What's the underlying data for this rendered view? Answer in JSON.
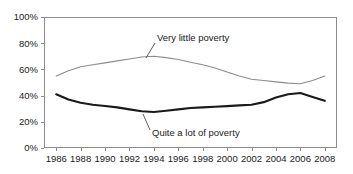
{
  "chart_data": {
    "type": "line",
    "title": "",
    "subtitle": "",
    "xlabel": "",
    "ylabel": "",
    "grid": false,
    "legend_position": "inline-annotations",
    "x": [
      1986,
      1987,
      1988,
      1989,
      1990,
      1991,
      1992,
      1993,
      1994,
      1995,
      1996,
      1997,
      1998,
      1999,
      2000,
      2001,
      2002,
      2003,
      2004,
      2005,
      2006,
      2007,
      2008
    ],
    "xlim": [
      1985,
      2009
    ],
    "ylim": [
      0,
      100
    ],
    "x_tick_labels": [
      "1986",
      "1988",
      "1990",
      "1992",
      "1994",
      "1996",
      "1998",
      "2000",
      "2002",
      "2004",
      "2006",
      "2008"
    ],
    "x_tick_values": [
      1986,
      1988,
      1990,
      1992,
      1994,
      1996,
      1998,
      2000,
      2002,
      2004,
      2006,
      2008
    ],
    "y_tick_labels": [
      "0%",
      "20%",
      "40%",
      "60%",
      "80%",
      "100%"
    ],
    "y_tick_values": [
      0,
      20,
      40,
      60,
      80,
      100
    ],
    "series": [
      {
        "name": "Very little poverty",
        "color": "#8c8c8c",
        "width": 1.1,
        "values": [
          55,
          59,
          62,
          63.5,
          65,
          66.5,
          68,
          69.5,
          70,
          69,
          67.5,
          65.5,
          63.5,
          61,
          58,
          55,
          52.5,
          51.5,
          50.5,
          49.5,
          49,
          51.5,
          55
        ]
      },
      {
        "name": "Quite a lot of poverty",
        "color": "#1a1a1a",
        "width": 2.1,
        "values": [
          41,
          37,
          34.5,
          33,
          32,
          31,
          29.5,
          28,
          27.5,
          28.5,
          29.5,
          30.5,
          31,
          31.5,
          32,
          32.5,
          33,
          35,
          38.5,
          41,
          42,
          39,
          36
        ]
      }
    ],
    "annotations": [
      {
        "name": "very-little-poverty",
        "text": "Very little poverty",
        "text_x": 157,
        "text_y": 41,
        "leader_from_x": 155,
        "leader_from_y": 43,
        "leader_to_x": 146,
        "leader_to_y": 58
      },
      {
        "name": "quite-a-lot-of-poverty",
        "text": "Quite a lot of poverty",
        "text_x": 152,
        "text_y": 136,
        "leader_from_x": 150,
        "leader_from_y": 130,
        "leader_to_x": 143,
        "leader_to_y": 114
      }
    ],
    "plot_box": {
      "left": 44,
      "top": 17,
      "right": 337,
      "bottom": 148
    },
    "axis_color": "#8c8c8c",
    "background": "#ffffff"
  }
}
